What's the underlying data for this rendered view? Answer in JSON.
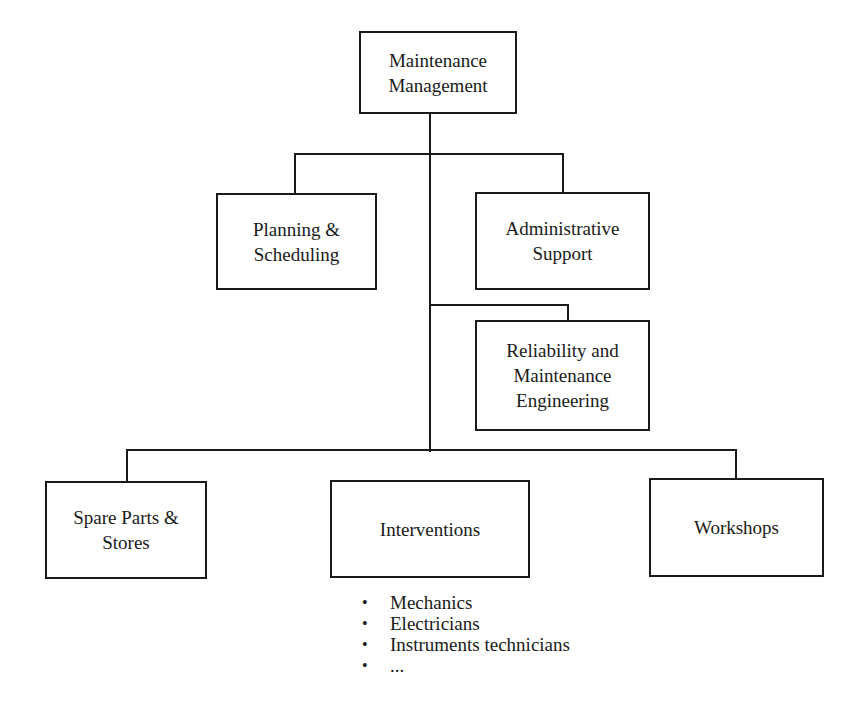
{
  "diagram": {
    "type": "organizational-chart",
    "colors": {
      "line": "#1a1a1a",
      "background": "#ffffff"
    },
    "root": {
      "label": "Maintenance\nManagement"
    },
    "level1": [
      {
        "id": "planning",
        "label": "Planning &\nScheduling"
      },
      {
        "id": "admin",
        "label": "Administrative\nSupport"
      }
    ],
    "level2": [
      {
        "id": "reliability",
        "label": "Reliability and\nMaintenance\nEngineering"
      }
    ],
    "level3": [
      {
        "id": "spare-parts",
        "label": "Spare Parts &\nStores"
      },
      {
        "id": "interventions",
        "label": "Interventions"
      },
      {
        "id": "workshops",
        "label": "Workshops"
      }
    ],
    "interventions_list": {
      "bullet": "•",
      "items": [
        "Mechanics",
        "Electricians",
        "Instruments technicians",
        "..."
      ]
    }
  }
}
